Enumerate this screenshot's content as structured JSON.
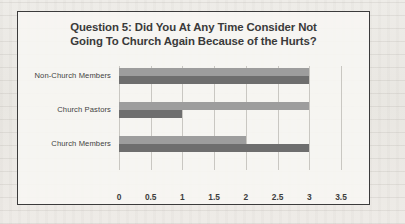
{
  "chart_data": {
    "type": "bar",
    "orientation": "horizontal",
    "title": "Question 5: Did You At Any Time Consider Not\nGoing To Church Again Because of the Hurts?",
    "xlabel": "",
    "ylabel": "",
    "categories": [
      "Church Members",
      "Church Pastors",
      "Non-Church Members"
    ],
    "categories_top_to_bottom": [
      "Non-Church Members",
      "Church Pastors",
      "Church Members"
    ],
    "series": [
      {
        "name": "series-a",
        "color": "#9d9d9d",
        "values": [
          2,
          3,
          3
        ]
      },
      {
        "name": "series-b",
        "color": "#6e6e6e",
        "values": [
          3,
          1,
          3
        ]
      }
    ],
    "xlim": [
      0,
      3.5
    ],
    "xticks": [
      0,
      0.5,
      1,
      1.5,
      2,
      2.5,
      3,
      3.5
    ],
    "xtick_labels": [
      "0",
      "0.5",
      "1",
      "1.5",
      "2",
      "2.5",
      "3",
      "3.5"
    ],
    "grid": true,
    "grid_axis": "x",
    "legend": false
  },
  "frame": {
    "border_color": "#3b3b3b",
    "background": "#f7f6f3"
  }
}
